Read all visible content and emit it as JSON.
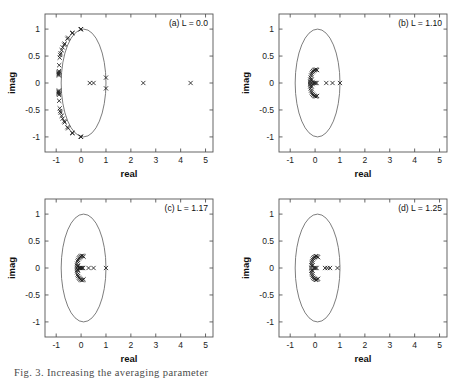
{
  "figure": {
    "caption": "Fig. 3. Increasing the averaging parameter",
    "panel_count": 4
  },
  "axes": {
    "xlabel": "real",
    "ylabel": "imag",
    "xlim": [
      -1.45,
      5.3
    ],
    "ylim": [
      -1.28,
      1.28
    ],
    "xticks": [
      -1,
      0,
      1,
      2,
      3,
      4,
      5
    ],
    "xticklabels": [
      "-1",
      "0",
      "1",
      "2",
      "3",
      "4",
      "5"
    ],
    "yticks": [
      -1,
      -0.5,
      0,
      0.5,
      1
    ],
    "yticklabels": [
      "-1",
      "-0.5",
      "0",
      "0.5",
      "1"
    ],
    "grid": false
  },
  "chart_data": [
    {
      "type": "scatter",
      "title": "(a) L = 0.0",
      "panel": "a",
      "L": 0.0,
      "xlabel": "real",
      "ylabel": "imag",
      "xlim": [
        -1.45,
        5.3
      ],
      "ylim": [
        -1.28,
        1.28
      ],
      "marker": "x",
      "marker_color": "#1c1c1c",
      "reference_curve": {
        "name": "unit-ellipse",
        "type": "ellipse",
        "cx": 0.1,
        "cy": 0.0,
        "rx": 0.9,
        "ry": 1.0,
        "color": "#666666"
      },
      "points": [
        [
          0.0,
          1.0
        ],
        [
          -0.02,
          0.995
        ],
        [
          -0.34,
          0.93
        ],
        [
          -0.36,
          0.925
        ],
        [
          -0.52,
          0.84
        ],
        [
          -0.55,
          0.82
        ],
        [
          -0.66,
          0.73
        ],
        [
          -0.68,
          0.71
        ],
        [
          -0.74,
          0.66
        ],
        [
          -0.78,
          0.61
        ],
        [
          -0.82,
          0.55
        ],
        [
          -0.84,
          0.52
        ],
        [
          -0.86,
          0.47
        ],
        [
          -0.88,
          0.33
        ],
        [
          -0.89,
          0.22
        ],
        [
          -0.9,
          0.2
        ],
        [
          -0.9,
          0.18
        ],
        [
          -0.9,
          0.16
        ],
        [
          -0.89,
          0.14
        ],
        [
          -0.89,
          -0.14
        ],
        [
          -0.9,
          -0.16
        ],
        [
          -0.9,
          -0.18
        ],
        [
          -0.9,
          -0.2
        ],
        [
          -0.89,
          -0.22
        ],
        [
          -0.88,
          -0.33
        ],
        [
          -0.86,
          -0.47
        ],
        [
          -0.84,
          -0.52
        ],
        [
          -0.82,
          -0.55
        ],
        [
          -0.78,
          -0.61
        ],
        [
          -0.74,
          -0.66
        ],
        [
          -0.68,
          -0.71
        ],
        [
          -0.66,
          -0.73
        ],
        [
          -0.55,
          -0.82
        ],
        [
          -0.52,
          -0.84
        ],
        [
          -0.36,
          -0.925
        ],
        [
          -0.34,
          -0.93
        ],
        [
          -0.02,
          -0.995
        ],
        [
          0.0,
          -1.0
        ],
        [
          0.35,
          0.0
        ],
        [
          0.5,
          0.0
        ],
        [
          1.0,
          0.1
        ],
        [
          1.0,
          -0.1
        ],
        [
          2.5,
          0.0
        ],
        [
          4.4,
          0.0
        ]
      ]
    },
    {
      "type": "scatter",
      "title": "(b) L = 1.10",
      "panel": "b",
      "L": 1.1,
      "xlabel": "real",
      "ylabel": "imag",
      "xlim": [
        -1.45,
        5.3
      ],
      "ylim": [
        -1.28,
        1.28
      ],
      "marker": "x",
      "marker_color": "#1c1c1c",
      "reference_curve": {
        "name": "unit-ellipse",
        "type": "ellipse",
        "cx": 0.1,
        "cy": 0.0,
        "rx": 0.9,
        "ry": 1.0,
        "color": "#666666"
      },
      "points": [
        [
          0.08,
          0.24
        ],
        [
          0.04,
          0.25
        ],
        [
          0.0,
          0.245
        ],
        [
          -0.04,
          0.235
        ],
        [
          -0.08,
          0.22
        ],
        [
          -0.11,
          0.2
        ],
        [
          -0.14,
          0.17
        ],
        [
          -0.16,
          0.14
        ],
        [
          -0.18,
          0.1
        ],
        [
          -0.19,
          0.06
        ],
        [
          -0.2,
          0.02
        ],
        [
          -0.2,
          -0.02
        ],
        [
          -0.19,
          -0.06
        ],
        [
          -0.18,
          -0.1
        ],
        [
          -0.16,
          -0.14
        ],
        [
          -0.14,
          -0.17
        ],
        [
          -0.11,
          -0.2
        ],
        [
          -0.08,
          -0.22
        ],
        [
          -0.04,
          -0.235
        ],
        [
          0.0,
          -0.245
        ],
        [
          0.04,
          -0.25
        ],
        [
          0.08,
          -0.24
        ],
        [
          -0.14,
          0.06
        ],
        [
          -0.14,
          -0.06
        ],
        [
          -0.1,
          0.02
        ],
        [
          -0.1,
          -0.02
        ],
        [
          -0.06,
          0.0
        ],
        [
          -0.02,
          0.0
        ],
        [
          0.02,
          0.0
        ],
        [
          0.06,
          0.0
        ],
        [
          0.45,
          0.0
        ],
        [
          0.7,
          0.0
        ],
        [
          1.0,
          0.0
        ]
      ]
    },
    {
      "type": "scatter",
      "title": "(c) L = 1.17",
      "panel": "c",
      "L": 1.17,
      "xlabel": "real",
      "ylabel": "imag",
      "xlim": [
        -1.45,
        5.3
      ],
      "ylim": [
        -1.28,
        1.28
      ],
      "marker": "x",
      "marker_color": "#1c1c1c",
      "reference_curve": {
        "name": "unit-ellipse",
        "type": "ellipse",
        "cx": 0.1,
        "cy": 0.0,
        "rx": 0.9,
        "ry": 1.0,
        "color": "#666666"
      },
      "points": [
        [
          0.1,
          0.21
        ],
        [
          0.06,
          0.225
        ],
        [
          0.02,
          0.225
        ],
        [
          -0.02,
          0.215
        ],
        [
          -0.06,
          0.2
        ],
        [
          -0.09,
          0.18
        ],
        [
          -0.12,
          0.15
        ],
        [
          -0.14,
          0.12
        ],
        [
          -0.16,
          0.08
        ],
        [
          -0.17,
          0.04
        ],
        [
          -0.17,
          0.0
        ],
        [
          -0.17,
          -0.04
        ],
        [
          -0.16,
          -0.08
        ],
        [
          -0.14,
          -0.12
        ],
        [
          -0.12,
          -0.15
        ],
        [
          -0.09,
          -0.18
        ],
        [
          -0.06,
          -0.2
        ],
        [
          -0.02,
          -0.215
        ],
        [
          0.02,
          -0.225
        ],
        [
          0.06,
          -0.225
        ],
        [
          0.1,
          -0.21
        ],
        [
          -0.12,
          0.04
        ],
        [
          -0.12,
          -0.04
        ],
        [
          -0.08,
          0.0
        ],
        [
          -0.04,
          0.0
        ],
        [
          0.0,
          0.0
        ],
        [
          0.04,
          0.0
        ],
        [
          0.08,
          0.0
        ],
        [
          0.3,
          0.0
        ],
        [
          0.5,
          0.0
        ],
        [
          1.0,
          0.0
        ]
      ]
    },
    {
      "type": "scatter",
      "title": "(d) L = 1.25",
      "panel": "d",
      "L": 1.25,
      "xlabel": "real",
      "ylabel": "imag",
      "xlim": [
        -1.45,
        5.3
      ],
      "ylim": [
        -1.28,
        1.28
      ],
      "marker": "x",
      "marker_color": "#1c1c1c",
      "reference_curve": {
        "name": "unit-ellipse",
        "type": "ellipse",
        "cx": 0.1,
        "cy": 0.0,
        "rx": 0.9,
        "ry": 1.0,
        "color": "#666666"
      },
      "points": [
        [
          0.12,
          0.2
        ],
        [
          0.08,
          0.215
        ],
        [
          0.04,
          0.22
        ],
        [
          0.0,
          0.21
        ],
        [
          -0.04,
          0.2
        ],
        [
          -0.07,
          0.18
        ],
        [
          -0.1,
          0.155
        ],
        [
          -0.12,
          0.125
        ],
        [
          -0.14,
          0.09
        ],
        [
          -0.15,
          0.05
        ],
        [
          -0.15,
          0.0
        ],
        [
          -0.15,
          -0.05
        ],
        [
          -0.14,
          -0.09
        ],
        [
          -0.12,
          -0.125
        ],
        [
          -0.1,
          -0.155
        ],
        [
          -0.07,
          -0.18
        ],
        [
          -0.04,
          -0.2
        ],
        [
          0.0,
          -0.21
        ],
        [
          0.04,
          -0.22
        ],
        [
          0.08,
          -0.215
        ],
        [
          0.12,
          -0.2
        ],
        [
          -0.1,
          0.05
        ],
        [
          -0.1,
          -0.05
        ],
        [
          -0.06,
          0.0
        ],
        [
          -0.02,
          0.0
        ],
        [
          0.02,
          0.0
        ],
        [
          0.06,
          0.0
        ],
        [
          0.4,
          0.0
        ],
        [
          0.5,
          0.0
        ],
        [
          0.6,
          0.0
        ],
        [
          0.9,
          0.0
        ]
      ]
    }
  ]
}
